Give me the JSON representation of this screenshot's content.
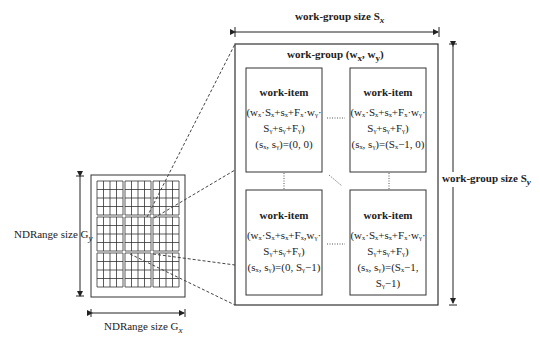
{
  "labels": {
    "wg_size_x": "work-group size S",
    "wg_size_x_sub": "x",
    "wg_size_y": "work-group size S",
    "wg_size_y_sub": "y",
    "wg_title": "work-group (w",
    "wg_title_x": "x",
    "wg_title_mid": ", w",
    "wg_title_y": "y",
    "wg_title_end": ")",
    "nd_size_y": "NDRange size G",
    "nd_size_y_sub": "y",
    "nd_size_x": "NDRange size G",
    "nd_size_x_sub": "x"
  },
  "work_items": [
    {
      "title": "work-item",
      "line1": "(wₓ·Sₓ+sₓ+Fₓ·wᵧ·",
      "line2": "Sᵧ+sᵧ+Fᵧ)",
      "line3": "(sₓ, sᵧ)=(0, 0)"
    },
    {
      "title": "work-item",
      "line1": "(wₓ·Sₓ+sₓ+Fₓ·wᵧ·",
      "line2": "Sᵧ+sᵧ+Fᵧ)",
      "line3": "(sₓ, sᵧ)=(Sₓ−1, 0)"
    },
    {
      "title": "work-item",
      "line1": "(wₓ·Sₓ+sₓ+Fₓ,wᵧ·",
      "line2": "Sᵧ+sᵧ+Fᵧ)",
      "line3": "(sₓ, sᵧ)=(0, Sᵧ−1)"
    },
    {
      "title": "work-item",
      "line1": "(wₓ·Sₓ+sₓ+Fₓ·wᵧ·",
      "line2": "Sᵧ+sᵧ+Fᵧ)",
      "line3": "(sₓ, sᵧ)=(Sₓ−1, Sᵧ−1)"
    }
  ],
  "grid": {
    "blocks_x": 3,
    "blocks_y": 3,
    "cells_per_block": 4
  }
}
